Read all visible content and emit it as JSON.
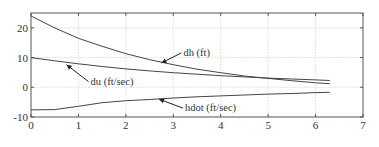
{
  "chart_data": {
    "type": "line",
    "title": "",
    "xlabel": "",
    "ylabel": "",
    "xlim": [
      0,
      7
    ],
    "ylim": [
      -10,
      25
    ],
    "xticks": [
      0,
      1,
      2,
      3,
      4,
      5,
      6,
      7
    ],
    "yticks": [
      -10,
      0,
      10,
      20
    ],
    "xtick_labels": [
      "0",
      "1",
      "2",
      "3",
      "4",
      "5",
      "6",
      "7"
    ],
    "ytick_labels": [
      "-10",
      "0",
      "10",
      "20"
    ],
    "grid": true,
    "series": [
      {
        "name": "dh (ft)",
        "x": [
          0,
          0.5,
          1,
          1.5,
          2,
          2.5,
          3,
          3.5,
          4,
          4.5,
          5,
          5.5,
          6,
          6.3
        ],
        "y": [
          24,
          20,
          16.5,
          13.8,
          11.3,
          9.3,
          7.6,
          6.1,
          4.9,
          3.8,
          3.0,
          2.2,
          1.5,
          1.2
        ]
      },
      {
        "name": "du (ft/sec)",
        "x": [
          0,
          0.5,
          1,
          1.5,
          2,
          2.5,
          3,
          3.5,
          4,
          4.5,
          5,
          5.5,
          6,
          6.3
        ],
        "y": [
          10,
          8.9,
          7.9,
          7.0,
          6.2,
          5.5,
          4.9,
          4.4,
          3.9,
          3.5,
          3.1,
          2.8,
          2.5,
          2.3
        ]
      },
      {
        "name": "hdot (ft/sec)",
        "x": [
          0,
          0.5,
          1,
          1.5,
          2,
          2.5,
          3,
          3.5,
          4,
          4.5,
          5,
          5.5,
          6,
          6.3
        ],
        "y": [
          -7.6,
          -7.5,
          -6.4,
          -5.2,
          -4.5,
          -4.1,
          -3.6,
          -3.2,
          -2.9,
          -2.6,
          -2.3,
          -2.1,
          -1.8,
          -1.7
        ]
      }
    ],
    "annotations": [
      {
        "text": "dh (ft)",
        "series": "dh (ft)",
        "arrow_to": [
          2.75,
          8.2
        ]
      },
      {
        "text": "du (ft/sec)",
        "series": "du (ft/sec)",
        "arrow_to": [
          0.75,
          7.6
        ]
      },
      {
        "text": "hdot (ft/sec)",
        "series": "hdot (ft/sec)",
        "arrow_to": [
          2.7,
          -4.0
        ]
      }
    ]
  }
}
